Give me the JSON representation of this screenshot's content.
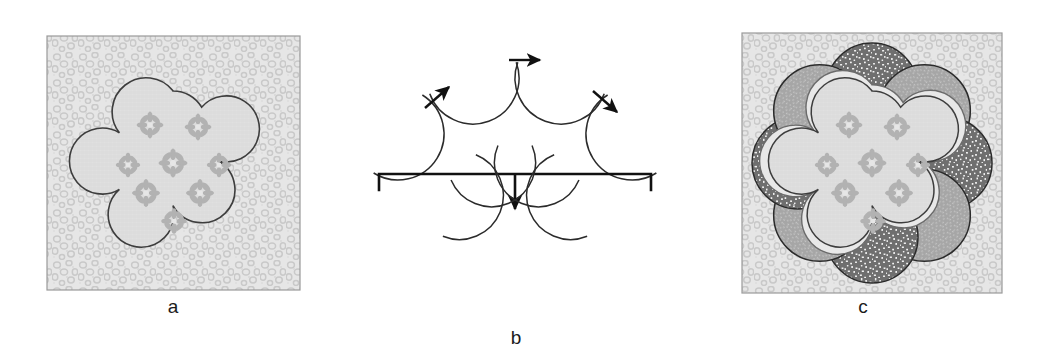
{
  "figure": {
    "width": 1040,
    "height": 364,
    "background_color": "#ffffff"
  },
  "panels": [
    {
      "id": "a",
      "label": "a",
      "description": "Textured square field containing a seven-lobed cloud-shaped core decorated with seven flower motifs",
      "frame": {
        "x": 47,
        "y": 36,
        "width": 253,
        "height": 254
      },
      "core": {
        "lobes": 7,
        "flower_motifs": 7,
        "center_x": 173,
        "center_y": 163,
        "radius": 72
      }
    },
    {
      "id": "b",
      "label": "b",
      "description": "Four crescent subunits converging with arrows, then assembled below into an open arc",
      "top_row_units": 4,
      "bottom_row_units": 4,
      "arrows": 3,
      "bracket": {
        "x1": 378,
        "x2": 650,
        "y": 174,
        "arrow_y": 206
      }
    },
    {
      "id": "c",
      "label": "c",
      "description": "Completed assembly: eight crescent subunits encircling the seven-lobed core inside the textured square",
      "frame": {
        "x": 742,
        "y": 33,
        "width": 260,
        "height": 260
      },
      "petals": 8,
      "core": {
        "lobes": 7,
        "flower_motifs": 7,
        "center_x": 872,
        "center_y": 163
      }
    }
  ],
  "colors": {
    "background": "#ffffff",
    "field_fill": "#e3e3e3",
    "field_stroke": "#8f8f8f",
    "core_fill": "#dedede",
    "core_stroke": "#3d3d3d",
    "flower_fill": "#b4b4b4",
    "petal_dark_fill": "#6f6f6f",
    "petal_dark_speckle": "#f2f2f2",
    "petal_light_fill": "#a6a6a6",
    "petal_light_speckle": "#cfcfcf",
    "petal_stroke": "#2b2b2b",
    "arrow_color": "#111111",
    "label_color": "#1b1b1b"
  },
  "icons": {
    "arrow_right": "arrow-right-icon",
    "arrow_up_right": "arrow-up-right-icon",
    "arrow_down_right": "arrow-down-right-icon",
    "arrow_down": "arrow-down-icon",
    "bracket": "bracket-icon",
    "flower": "flower-motif-icon"
  }
}
